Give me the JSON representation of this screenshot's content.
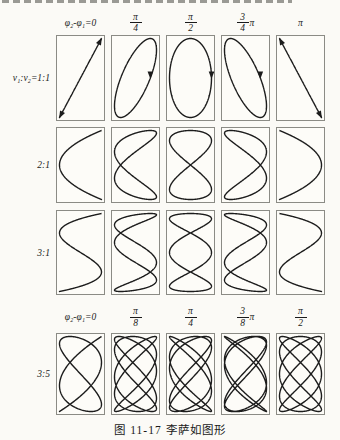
{
  "figure": {
    "caption": "图 11-17  李萨如图形"
  },
  "headers": [
    {
      "row": "top",
      "items": [
        {
          "text": "φ₂-φ₁=0"
        },
        {
          "num": "π",
          "den": "4"
        },
        {
          "num": "π",
          "den": "2"
        },
        {
          "num": "3",
          "den": "4",
          "suffix": "π"
        },
        {
          "text": "π"
        }
      ]
    },
    {
      "row": "bottom",
      "items": [
        {
          "text": "φ₂-φ₁=0"
        },
        {
          "num": "π",
          "den": "8"
        },
        {
          "num": "π",
          "den": "4"
        },
        {
          "num": "3",
          "den": "8",
          "suffix": "π"
        },
        {
          "num": "π",
          "den": "2"
        }
      ]
    }
  ],
  "rows": [
    {
      "label": "ν₁:ν₂=1:1",
      "ratio": "1:1",
      "xfreq": 1,
      "yfreq": 1,
      "phases_pi": [
        0,
        0.25,
        0.5,
        0.75,
        1
      ],
      "arrows": true
    },
    {
      "label": "2:1",
      "ratio": "2:1",
      "xfreq": 2,
      "yfreq": 1,
      "phases_pi": [
        0,
        0.25,
        0.5,
        0.75,
        1
      ],
      "arrows": false
    },
    {
      "label": "3:1",
      "ratio": "3:1",
      "xfreq": 3,
      "yfreq": 1,
      "phases_pi": [
        0,
        0.25,
        0.5,
        0.75,
        1
      ],
      "arrows": false
    },
    {
      "label": "3:5",
      "ratio": "3:5",
      "xfreq": 5,
      "yfreq": 3,
      "phases_pi": [
        0,
        0.125,
        0.25,
        0.375,
        0.5
      ],
      "arrows": false
    }
  ],
  "style": {
    "curve_color": "#1c1c1c",
    "cell_border": "#8b8b85",
    "text_color": "#1a1a1a",
    "background": "#fbfaf6"
  }
}
